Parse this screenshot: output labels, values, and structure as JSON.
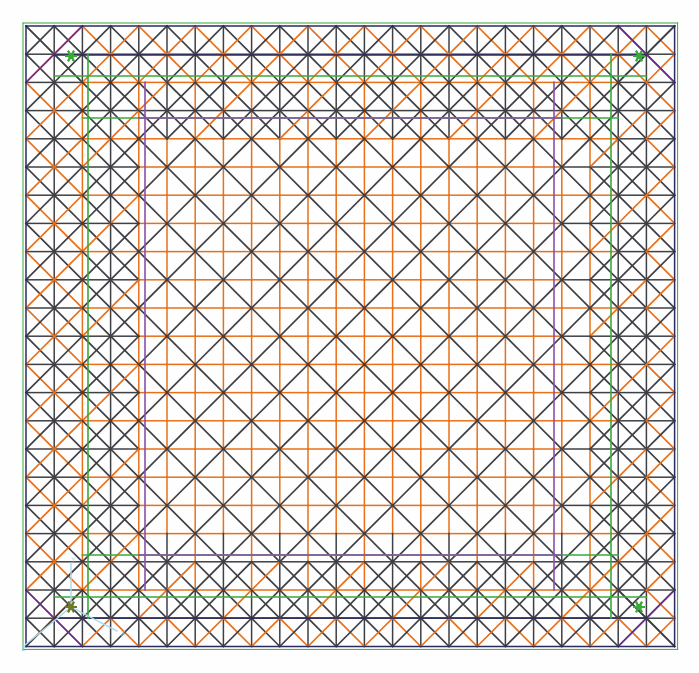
{
  "view": {
    "title": "Finite Element Mesh",
    "background_color": "#fefefe",
    "width": 699,
    "height": 673
  },
  "mesh": {
    "description": "Structured triangular finite-element mesh of a square plate",
    "origin_x": 26,
    "origin_y": 26,
    "cell_size": 28.2,
    "cols": 23,
    "rows": 22,
    "edge_colors": {
      "diagonal": "#3f3f46",
      "interior_grid": "#e8701a",
      "boundary_outer": "#2b2b5e",
      "constraint_green": "#3aa93a",
      "constraint_purple": "#6b2d8c",
      "constraint_violet": "#8b4fa8",
      "axis_triad": "#a8d8ec",
      "marker_star": "#3aa93a"
    },
    "line_widths": {
      "diagonal": 1.7,
      "grid": 1.5,
      "boundary": 1.5,
      "highlight": 1.6
    },
    "band": {
      "outer_ring_cells": 2,
      "mid_ring_cells": 2,
      "core_start_col": 4,
      "core_end_col": 19,
      "core_start_row": 4,
      "core_end_row": 18
    }
  },
  "markers": {
    "corner_stars": [
      {
        "name": "constraint-star-top-left",
        "x": 71,
        "y": 56,
        "color": "#3aa93a"
      },
      {
        "name": "constraint-star-top-right",
        "x": 639,
        "y": 56,
        "color": "#3aa93a"
      },
      {
        "name": "constraint-star-bottom-left",
        "x": 71,
        "y": 607,
        "color": "#6d7a2a"
      },
      {
        "name": "constraint-star-bottom-right",
        "x": 639,
        "y": 607,
        "color": "#3aa93a"
      }
    ]
  },
  "axis_triad": {
    "name": "coordinate-axis-triad",
    "origin_x": 71,
    "origin_y": 607,
    "color": "#a8d8ec",
    "axes": [
      {
        "label": "X",
        "dx": 46,
        "dy": 24
      },
      {
        "label": "Y",
        "dx": 0,
        "dy": -44
      },
      {
        "label": "Z",
        "dx": -46,
        "dy": 38
      }
    ]
  },
  "highlight_lines": {
    "top_navy_y": 55,
    "top_green_y": 76,
    "second_green_y": 118,
    "second_violet_y": 118,
    "bottom_navy_y": 618,
    "bottom_green_y": 597,
    "lower_green_y": 555,
    "left_navy_x": 26,
    "left_green_x": 88,
    "left_violet_x": 145,
    "right_navy_x": 672,
    "right_green_x": 611,
    "right_violet_x": 554
  }
}
